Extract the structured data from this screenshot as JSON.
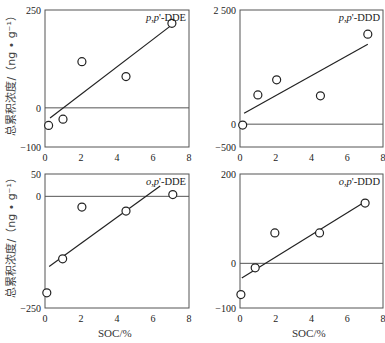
{
  "figure": {
    "y_axis_label": "总累积浓度/（ng • g⁻¹）",
    "x_axis_label": "SOC/%"
  },
  "chart_data": [
    {
      "type": "scatter",
      "title": "p,p'-DDE",
      "title_parts": [
        "p",
        ",",
        "p",
        "'-DDE"
      ],
      "xlabel": "",
      "ylabel": "总累积浓度/（ng • g⁻¹）",
      "xlim": [
        0,
        8
      ],
      "ylim": [
        -100,
        250
      ],
      "xticks": [
        0,
        2,
        4,
        6,
        8
      ],
      "yticks": [
        250,
        0,
        -100
      ],
      "ytick_labels": [
        "250",
        "0",
        "-100"
      ],
      "zero_line": true,
      "grid": false,
      "points": [
        {
          "x": 0.2,
          "y": -45
        },
        {
          "x": 1.0,
          "y": -29
        },
        {
          "x": 2.05,
          "y": 118
        },
        {
          "x": 4.5,
          "y": 80
        },
        {
          "x": 7.05,
          "y": 216
        }
      ],
      "fit_line": [
        {
          "x": 0.28,
          "y": -26
        },
        {
          "x": 7.05,
          "y": 212
        }
      ]
    },
    {
      "type": "scatter",
      "title": "p,p'-DDD",
      "title_parts": [
        "p",
        ",",
        "p",
        "'-DDD"
      ],
      "xlabel": "",
      "ylabel": "",
      "xlim": [
        0,
        8
      ],
      "ylim": [
        -500,
        2500
      ],
      "xticks": [
        0,
        2,
        4,
        6,
        8
      ],
      "yticks": [
        2500,
        0,
        -500
      ],
      "ytick_labels": [
        "2 500",
        "0",
        "-500"
      ],
      "zero_line": true,
      "grid": false,
      "points": [
        {
          "x": 0.15,
          "y": -20
        },
        {
          "x": 1.0,
          "y": 640
        },
        {
          "x": 2.05,
          "y": 970
        },
        {
          "x": 4.5,
          "y": 620
        },
        {
          "x": 7.15,
          "y": 1970
        }
      ],
      "fit_line": [
        {
          "x": 0.23,
          "y": 240
        },
        {
          "x": 7.15,
          "y": 1750
        }
      ]
    },
    {
      "type": "scatter",
      "title": "o,p'-DDE",
      "title_parts": [
        "o",
        ",",
        "p",
        "'-DDE"
      ],
      "xlabel": "SOC/%",
      "ylabel": "总累积浓度/（ng • g⁻¹）",
      "xlim": [
        0,
        8
      ],
      "ylim": [
        -250,
        50
      ],
      "xticks": [
        0,
        2,
        4,
        6,
        8
      ],
      "yticks": [
        50,
        0,
        -250
      ],
      "ytick_labels": [
        "50",
        "0",
        "-250"
      ],
      "zero_line": true,
      "grid": false,
      "points": [
        {
          "x": 0.1,
          "y": -216
        },
        {
          "x": 0.98,
          "y": -140
        },
        {
          "x": 2.05,
          "y": -24
        },
        {
          "x": 4.5,
          "y": -33
        },
        {
          "x": 7.1,
          "y": 4
        }
      ],
      "fit_line": [
        {
          "x": 0.23,
          "y": -157
        },
        {
          "x": 6.4,
          "y": 23
        }
      ]
    },
    {
      "type": "scatter",
      "title": "o,p'-DDD",
      "title_parts": [
        "o",
        ",",
        "p",
        "'-DDD"
      ],
      "xlabel": "SOC/%",
      "ylabel": "",
      "xlim": [
        0,
        8
      ],
      "ylim": [
        -100,
        200
      ],
      "xticks": [
        0,
        2,
        4,
        6,
        8
      ],
      "yticks": [
        200,
        0,
        -100
      ],
      "ytick_labels": [
        "200",
        "0",
        "-100"
      ],
      "zero_line": true,
      "grid": false,
      "points": [
        {
          "x": 0.05,
          "y": -70
        },
        {
          "x": 0.85,
          "y": -10
        },
        {
          "x": 1.95,
          "y": 68
        },
        {
          "x": 4.45,
          "y": 68
        },
        {
          "x": 7.0,
          "y": 135
        }
      ],
      "fit_line": [
        {
          "x": 0.1,
          "y": -33
        },
        {
          "x": 6.95,
          "y": 137
        }
      ]
    }
  ]
}
